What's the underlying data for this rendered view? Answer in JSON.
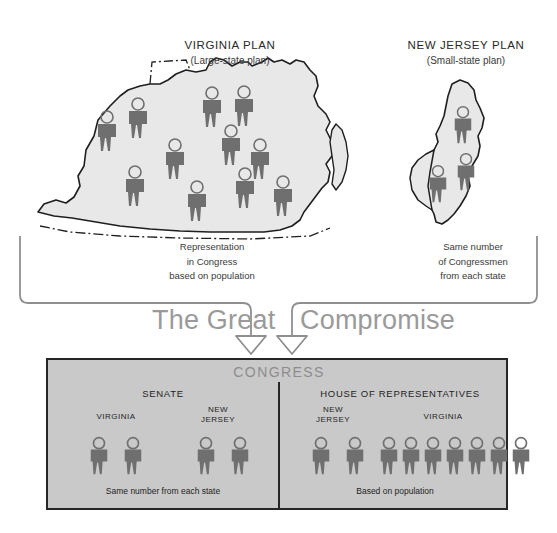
{
  "diagram": {
    "compromise_word_1": "The Great",
    "compromise_word_2": "Compromise"
  },
  "plans": [
    {
      "id": "virginia-plan",
      "title": "VIRGINIA PLAN",
      "subtitle": "(Large-state plan)",
      "map_state": "Virginia",
      "figure_count": 11,
      "caption": "Representation\nin Congress\nbased on population"
    },
    {
      "id": "new-jersey-plan",
      "title": "NEW JERSEY PLAN",
      "subtitle": "(Small-state plan)",
      "map_state": "New Jersey",
      "figure_count": 3,
      "caption": "Same number\nof Congressmen\nfrom each state"
    }
  ],
  "congress": {
    "title": "CONGRESS",
    "chambers": [
      {
        "id": "senate",
        "title": "SENATE",
        "caption": "Same number from each state",
        "delegations": [
          {
            "state": "VIRGINIA",
            "figure_count": 2
          },
          {
            "state": "NEW\nJERSEY",
            "figure_count": 2
          }
        ]
      },
      {
        "id": "house-of-representatives",
        "title": "HOUSE OF REPRESENTATIVES",
        "caption": "Based on population",
        "delegations": [
          {
            "state": "NEW\nJERSEY",
            "figure_count": 2
          },
          {
            "state": "VIRGINIA",
            "figure_count": 7
          }
        ]
      }
    ]
  },
  "colors": {
    "figure": "#6f6f6f",
    "map_fill": "#e8e8e8",
    "map_outline": "#1f1f1f",
    "congress_fill": "#c9c9c9",
    "congress_border": "#262626",
    "bracket": "#8f8f8f",
    "wordmark": "#9a9a9a",
    "page_background": "#ffffff"
  },
  "icons": {
    "person": "person-icon",
    "arrow_down": "arrow-down-icon",
    "bracket": "bracket-connector-icon"
  }
}
